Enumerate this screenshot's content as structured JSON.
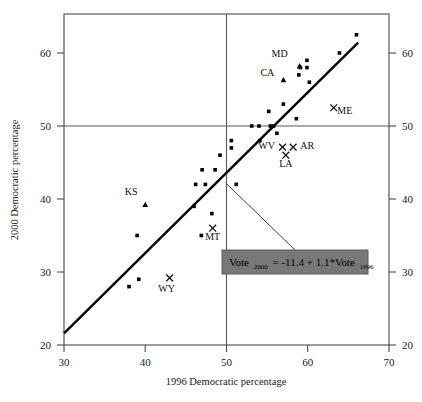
{
  "chart_data": {
    "type": "scatter",
    "title": "",
    "xlabel": "1996 Democratic percentage",
    "ylabel": "2000 Democratic percentage",
    "xlim": [
      30,
      70
    ],
    "ylim": [
      20,
      65
    ],
    "xticks": [
      30,
      40,
      50,
      60,
      70
    ],
    "yticks": [
      20,
      30,
      40,
      50,
      60
    ],
    "yticks_right": [
      20,
      30,
      40,
      50,
      60
    ],
    "grid": false,
    "reference_lines": [
      {
        "name": "vertical-50",
        "orientation": "vertical",
        "value": 50
      },
      {
        "name": "horizontal-50",
        "orientation": "horizontal",
        "value": 50
      }
    ],
    "fit_line": {
      "intercept": -11.4,
      "slope": 1.1,
      "equation": "Vote 2000 = -11.4 + 1.1*Vote 1996",
      "x_start": 30,
      "x_end": 66.2
    },
    "series": [
      {
        "name": "states-unlabeled",
        "marker": "dot",
        "points": [
          [
            38.0,
            28.0
          ],
          [
            39.2,
            29.0
          ],
          [
            39.0,
            35.0
          ],
          [
            46.0,
            39.0
          ],
          [
            46.2,
            42.0
          ],
          [
            47.4,
            42.0
          ],
          [
            47.0,
            44.0
          ],
          [
            48.2,
            38.0
          ],
          [
            46.9,
            35.0
          ],
          [
            48.6,
            44.0
          ],
          [
            49.2,
            46.0
          ],
          [
            50.6,
            47.0
          ],
          [
            50.6,
            48.0
          ],
          [
            51.2,
            42.0
          ],
          [
            53.1,
            50.0
          ],
          [
            54.0,
            50.0
          ],
          [
            54.1,
            48.0
          ],
          [
            55.4,
            50.0
          ],
          [
            55.8,
            50.0
          ],
          [
            55.2,
            52.0
          ],
          [
            56.2,
            49.0
          ],
          [
            57.0,
            53.0
          ],
          [
            58.6,
            51.0
          ],
          [
            58.9,
            57.0
          ],
          [
            59.1,
            58.0
          ],
          [
            59.9,
            59.0
          ],
          [
            59.9,
            58.0
          ],
          [
            60.2,
            56.0
          ],
          [
            63.9,
            60.0
          ],
          [
            66.0,
            62.5
          ]
        ]
      },
      {
        "name": "states-triangle",
        "marker": "triangle",
        "points": [
          {
            "x": 40.0,
            "y": 39.2,
            "label": "KS",
            "label_dx": -14,
            "label_dy": -10
          },
          {
            "x": 57.0,
            "y": 56.3,
            "label": "CA",
            "label_dx": -16,
            "label_dy": -4
          },
          {
            "x": 59.0,
            "y": 58.2,
            "label": "MD",
            "label_dx": -20,
            "label_dy": -9
          }
        ]
      },
      {
        "name": "states-x",
        "marker": "x",
        "points": [
          {
            "x": 43.0,
            "y": 29.2,
            "label": "WY",
            "label_dx": -3,
            "label_dy": 14
          },
          {
            "x": 48.3,
            "y": 36.0,
            "label": "MT",
            "label_dx": 0,
            "label_dy": 12
          },
          {
            "x": 56.9,
            "y": 47.1,
            "label": "WV",
            "label_dx": -16,
            "label_dy": 2
          },
          {
            "x": 58.2,
            "y": 47.1,
            "label": "AR",
            "label_dx": 14,
            "label_dy": 2
          },
          {
            "x": 57.3,
            "y": 46.0,
            "label": "LA",
            "label_dx": 0,
            "label_dy": 12
          },
          {
            "x": 63.2,
            "y": 52.5,
            "label": "ME",
            "label_dx": 11,
            "label_dy": 6
          }
        ]
      }
    ],
    "annotation": {
      "name": "regression-equation",
      "prefix": "Vote",
      "sub1": "2000",
      "middle": "= -11.4 + 1.1*Vote",
      "sub2": "1996",
      "leader_from": [
        49.9,
        42.2
      ]
    }
  }
}
